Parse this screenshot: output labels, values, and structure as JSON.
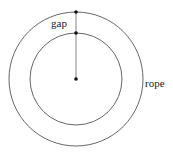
{
  "diagram": {
    "labels": {
      "gap": "gap",
      "rope": "rope"
    },
    "colors": {
      "stroke": "#555555",
      "dot": "#111111",
      "text": "#222222"
    },
    "geometry": {
      "center": [
        76,
        79
      ],
      "outer_radius": 67,
      "inner_radius": 46
    }
  }
}
